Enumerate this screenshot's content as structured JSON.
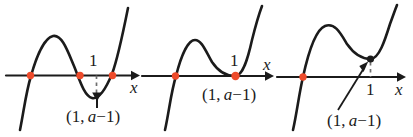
{
  "figure": {
    "width": 413,
    "height": 137,
    "background": "#ffffff",
    "curve_color": "#1b1b1b",
    "axis_color": "#1b1b1b",
    "root_dot_color": "#ee4b2b",
    "vertex_dot_color": "#1b1b1b",
    "dashed_color": "#6f6f6f"
  },
  "panels": [
    {
      "id": "panel-left",
      "case_label": "a - 1 < 0",
      "axis_label": "x",
      "tick_label": "1",
      "point_label_parts": {
        "open": "(1, ",
        "variable": "a",
        "close": "−1)"
      },
      "point_label": "(1, a−1)",
      "x_intercepts": [
        "left",
        "middle",
        "right"
      ],
      "x_intercept_count": 3,
      "vertex_below_axis": true,
      "has_dashed_drop": true,
      "has_arrow_annotation": true
    },
    {
      "id": "panel-middle",
      "case_label": "a - 1 = 0",
      "axis_label": "x",
      "tick_label": "1",
      "point_label_parts": {
        "open": "(1, ",
        "variable": "a",
        "close": "−1)"
      },
      "point_label": "(1, a−1)",
      "x_intercepts": [
        "left",
        "tangent-at-1"
      ],
      "x_intercept_count": 2,
      "vertex_below_axis": false,
      "has_dashed_drop": false,
      "has_arrow_annotation": false
    },
    {
      "id": "panel-right",
      "case_label": "a - 1 > 0",
      "axis_label": "x",
      "tick_label": "1",
      "point_label_parts": {
        "open": "(1, ",
        "variable": "a",
        "close": "−1)"
      },
      "point_label": "(1, a−1)",
      "x_intercepts": [
        "left"
      ],
      "x_intercept_count": 1,
      "vertex_below_axis": false,
      "has_dashed_drop": true,
      "has_arrow_annotation": true
    }
  ]
}
